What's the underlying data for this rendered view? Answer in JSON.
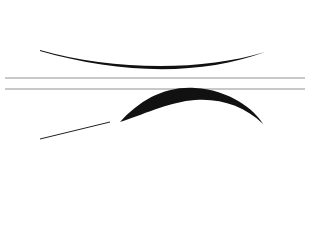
{
  "band": {
    "label": "Anti IgG (Fc Spec)"
  },
  "top_row": {
    "cells": [
      "1",
      "2",
      "3",
      "4",
      "5",
      "6",
      "7",
      "8",
      "9",
      "10"
    ],
    "antibody_labels": [
      [
        "1",
        "1"
      ],
      [
        "2",
        "2"
      ],
      [
        "3",
        "3"
      ],
      [
        "4",
        "4"
      ],
      [
        "5",
        "5"
      ],
      [
        "6",
        "6"
      ],
      [
        "7",
        "7"
      ],
      [
        "8",
        "8"
      ],
      [
        "9",
        "9"
      ],
      [
        "10",
        "10"
      ]
    ]
  },
  "bottom_row": {
    "singles": [
      "1",
      "3",
      "5"
    ],
    "cluster_row": [
      "7",
      "7",
      "7",
      "7",
      "7",
      "9"
    ],
    "pyramid": [
      [
        "7",
        "7",
        "7",
        "7"
      ],
      [
        "7",
        "7",
        "7"
      ],
      [
        "7",
        "7"
      ],
      [
        "7"
      ]
    ]
  },
  "colors": {
    "ink": "#111111",
    "line": "#555555",
    "background": "#ffffff"
  }
}
